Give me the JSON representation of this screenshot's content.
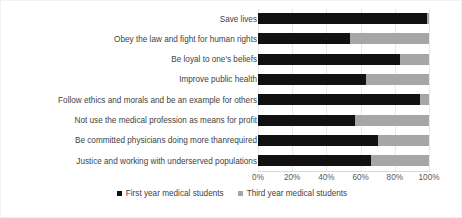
{
  "chart_data": {
    "type": "bar",
    "orientation": "horizontal",
    "stacked": true,
    "stack_mode": "percent",
    "title": "",
    "subtitle": "",
    "xlabel": "",
    "ylabel": "",
    "xlim": [
      0,
      100
    ],
    "grid": true,
    "legend_position": "bottom",
    "tick_labels": [
      "0%",
      "20%",
      "40%",
      "60%",
      "80%",
      "100%"
    ],
    "tick_values": [
      0,
      20,
      40,
      60,
      80,
      100
    ],
    "categories": [
      "Save lives",
      "Obey the law and fight for human rights",
      "Be loyal to one's beliefs",
      "Improve public health",
      "Follow ethics and morals and be an example for others",
      "Not use the medical profession as means for profit",
      "Be committed physicians doing more thanrequired",
      "Justice and working with underserved populations"
    ],
    "series": [
      {
        "name": "First year medical students",
        "color": "#111111",
        "values": [
          99,
          54,
          83,
          63,
          95,
          57,
          70,
          66
        ]
      },
      {
        "name": "Third year medical students",
        "color": "#a6a6a6",
        "values": [
          1,
          46,
          17,
          37,
          5,
          43,
          30,
          34
        ]
      }
    ]
  },
  "legend": {
    "items": [
      {
        "label": "First year medical students",
        "swatch": "black-square-marker"
      },
      {
        "label": "Third year medical students",
        "swatch": "gray-square-marker"
      }
    ]
  },
  "colors": {
    "first_year": "#111111",
    "third_year": "#a6a6a6",
    "gridline": "#e8e8e8",
    "axis": "#d9d9d9",
    "text": "#3f3f3f",
    "background": "#ffffff"
  }
}
